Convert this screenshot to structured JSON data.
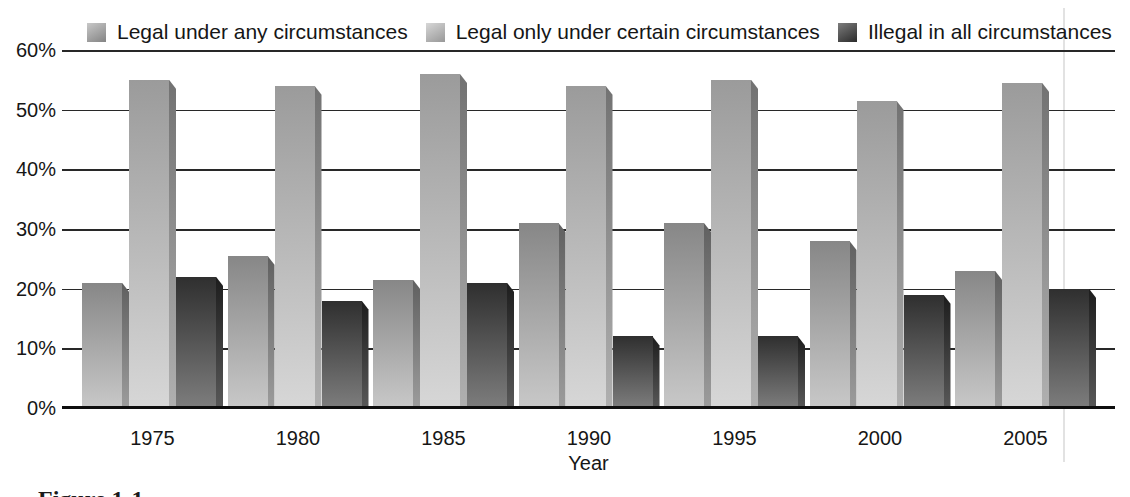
{
  "figure_caption": "Figure 1-1",
  "axis": {
    "x_title": "Year",
    "yticks": [
      "0%",
      "10%",
      "20%",
      "30%",
      "40%",
      "50%",
      "60%"
    ]
  },
  "chart_data": {
    "type": "bar",
    "title": "",
    "categories": [
      "1975",
      "1980",
      "1985",
      "1990",
      "1995",
      "2000",
      "2005"
    ],
    "series": [
      {
        "name": "Legal under any circumstances",
        "values": [
          21,
          25.5,
          21.5,
          31,
          31,
          28,
          23
        ],
        "face": [
          "#878787",
          "#c8c8c8"
        ],
        "side": [
          "#606060",
          "#9c9c9c"
        ]
      },
      {
        "name": "Legal only under certain circumstances",
        "values": [
          55,
          54,
          56,
          54,
          55,
          51.5,
          54.5
        ],
        "face": [
          "#9b9b9b",
          "#d7d7d7"
        ],
        "side": [
          "#727272",
          "#b0b0b0"
        ]
      },
      {
        "name": "Illegal in all circumstances",
        "values": [
          22,
          18,
          21,
          12,
          12,
          19,
          20
        ],
        "face": [
          "#2f2f2f",
          "#7d7d7d"
        ],
        "side": [
          "#1d1d1d",
          "#585858"
        ]
      }
    ],
    "xlabel": "Year",
    "ylabel": "",
    "ylim": [
      0,
      60
    ],
    "ytick_step": 10,
    "ytick_format": "percent",
    "grid": "horizontal",
    "legend_position": "top"
  },
  "colors": {
    "gridline": "#282828",
    "baseline": "#0e0e0e",
    "text": "#161616",
    "background": "#ffffff",
    "scan_fold_line": "#e2e2e2"
  }
}
